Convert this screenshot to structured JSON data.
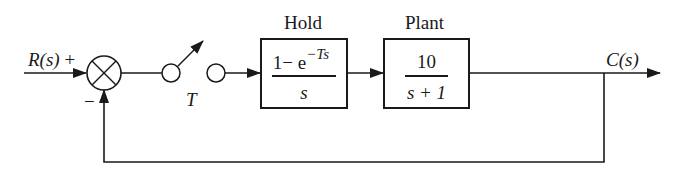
{
  "diagram": {
    "type": "sampled-data feedback control block diagram",
    "input": {
      "label": "R(s)",
      "sign": "+"
    },
    "summing_junction": {
      "feedback_sign": "−"
    },
    "sampler": {
      "label": "T"
    },
    "blocks": [
      {
        "title": "Hold",
        "numerator": "1− e",
        "exponent": "−Ts",
        "denominator": "s"
      },
      {
        "title": "Plant",
        "numerator": "10",
        "denominator": "s + 1"
      }
    ],
    "output": {
      "label": "C(s)"
    },
    "colors": {
      "ink": "#1a1a1a",
      "background": "#ffffff"
    }
  }
}
